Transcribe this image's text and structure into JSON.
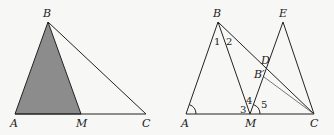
{
  "colors": {
    "background": "#f7f7f5",
    "line": "#222222",
    "shaded_fill": "#8c8c8c"
  },
  "figure_left": {
    "points": {
      "A": {
        "label": "A",
        "x": 15,
        "y": 114
      },
      "B": {
        "label": "B",
        "x": 48,
        "y": 22
      },
      "M": {
        "label": "M",
        "x": 81,
        "y": 114
      },
      "C": {
        "label": "C",
        "x": 146,
        "y": 114
      }
    },
    "shaded_triangle": "ABM"
  },
  "figure_right": {
    "points": {
      "A": {
        "label": "A",
        "x": 186,
        "y": 114
      },
      "B": {
        "label": "B",
        "x": 218,
        "y": 22
      },
      "M": {
        "label": "M",
        "x": 250,
        "y": 114
      },
      "C": {
        "label": "C",
        "x": 314,
        "y": 114
      },
      "E": {
        "label": "E",
        "x": 283,
        "y": 22
      },
      "D": {
        "label": "D",
        "x": 267,
        "y": 69
      },
      "Bp": {
        "label": "B′",
        "x": 264,
        "y": 77
      }
    },
    "angle_labels": [
      "1",
      "2",
      "3",
      "4",
      "5"
    ]
  }
}
